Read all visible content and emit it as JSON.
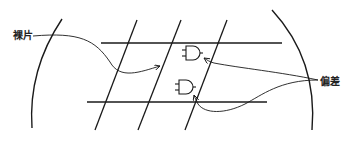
{
  "diagram": {
    "type": "wafer-die-offset-illustration",
    "labels": {
      "die": "裸片",
      "offset": "偏差"
    },
    "elements": {
      "wafer_edges": [
        "left-arc",
        "right-arc"
      ],
      "horizontal_scribe_lines": 2,
      "diagonal_scribe_lines": 3,
      "logic_gates": [
        {
          "type": "AND",
          "position": "upper"
        },
        {
          "type": "AND",
          "position": "lower"
        }
      ],
      "arrows": [
        {
          "from": "die",
          "to": "die-region"
        },
        {
          "from": "offset",
          "to": "upper-gate"
        },
        {
          "from": "offset",
          "to": "lower-gate"
        }
      ]
    },
    "colors": {
      "stroke": "#1a1a1a",
      "background": "#ffffff"
    }
  }
}
